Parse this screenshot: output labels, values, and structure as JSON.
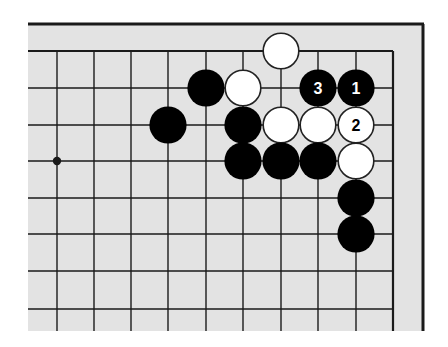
{
  "diagram": {
    "type": "go-board-fragment",
    "corner": "top-right",
    "colors": {
      "background": "#e3e3e3",
      "line": "#1a1a1a",
      "black_stone": "#000000",
      "white_stone": "#ffffff",
      "stone_outline": "#222222"
    },
    "grid": {
      "columns_x": [
        57,
        94,
        131,
        168,
        206,
        243,
        281,
        318,
        356,
        393
      ],
      "rows_y": [
        51,
        88,
        125,
        161,
        198,
        234,
        271,
        309
      ],
      "left_extent": 28,
      "bottom_extent": 331,
      "edge_column_index": 9,
      "edge_row_index": 0
    },
    "frame": {
      "left": 28,
      "top": 24,
      "right": 423,
      "bottom": 331
    },
    "hoshi": [
      {
        "col": 0,
        "row": 3
      }
    ],
    "stones": [
      {
        "color": "white",
        "col": 6,
        "row": 0,
        "label": ""
      },
      {
        "color": "black",
        "col": 4,
        "row": 1,
        "label": ""
      },
      {
        "color": "white",
        "col": 5,
        "row": 1,
        "label": ""
      },
      {
        "color": "black",
        "col": 7,
        "row": 1,
        "label": "3"
      },
      {
        "color": "black",
        "col": 8,
        "row": 1,
        "label": "1"
      },
      {
        "color": "black",
        "col": 3,
        "row": 2,
        "label": ""
      },
      {
        "color": "black",
        "col": 5,
        "row": 2,
        "label": ""
      },
      {
        "color": "white",
        "col": 6,
        "row": 2,
        "label": ""
      },
      {
        "color": "white",
        "col": 7,
        "row": 2,
        "label": ""
      },
      {
        "color": "white",
        "col": 8,
        "row": 2,
        "label": "2"
      },
      {
        "color": "black",
        "col": 5,
        "row": 3,
        "label": ""
      },
      {
        "color": "black",
        "col": 6,
        "row": 3,
        "label": ""
      },
      {
        "color": "black",
        "col": 7,
        "row": 3,
        "label": ""
      },
      {
        "color": "white",
        "col": 8,
        "row": 3,
        "label": ""
      },
      {
        "color": "black",
        "col": 8,
        "row": 4,
        "label": ""
      },
      {
        "color": "black",
        "col": 8,
        "row": 5,
        "label": ""
      }
    ],
    "move_labels": [
      "1",
      "2",
      "3"
    ]
  }
}
